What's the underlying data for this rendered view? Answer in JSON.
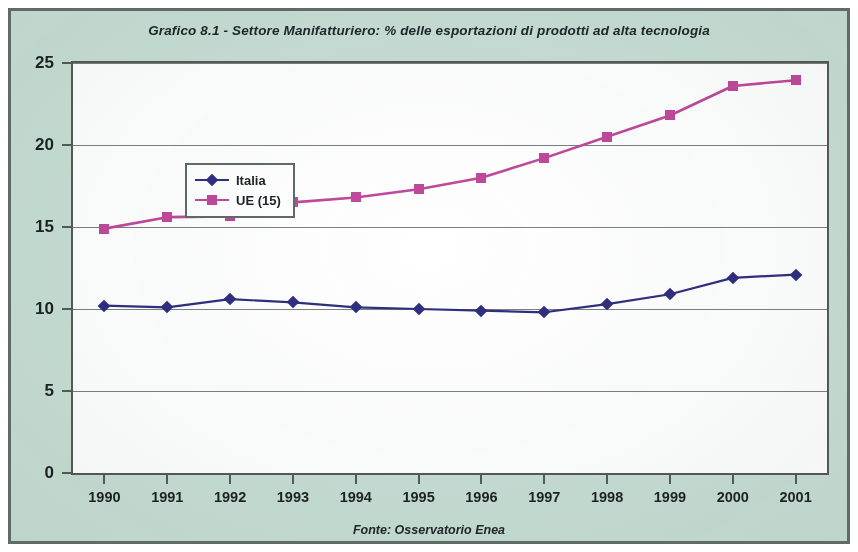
{
  "document": {
    "background_color": "#c8ded5",
    "border_color": "#5f6b66"
  },
  "chart_data": {
    "type": "line",
    "title": "Grafico 8.1 - Settore Manifatturiero:  % delle esportazioni di prodotti ad alta tecnologia",
    "source_note": "Fonte: Osservatorio Enea",
    "xlabel": "",
    "ylabel": "",
    "categories": [
      "1990",
      "1991",
      "1992",
      "1993",
      "1994",
      "1995",
      "1996",
      "1997",
      "1998",
      "1999",
      "2000",
      "2001"
    ],
    "ylim": [
      0,
      25
    ],
    "yticks": [
      "0",
      "5",
      "10",
      "15",
      "20",
      "25"
    ],
    "grid": true,
    "legend_position": "upper-left-inside",
    "series": [
      {
        "name": "Italia",
        "color": "#2f2f80",
        "marker": "diamond",
        "values": [
          10.2,
          10.1,
          10.6,
          10.4,
          10.1,
          10.0,
          9.9,
          9.8,
          10.3,
          10.9,
          11.9,
          12.1
        ]
      },
      {
        "name": "UE (15)",
        "color": "#c0499b",
        "marker": "square",
        "values": [
          14.9,
          15.6,
          15.65,
          16.5,
          16.8,
          17.3,
          18.0,
          19.2,
          20.5,
          21.8,
          23.6,
          23.95
        ]
      }
    ]
  }
}
